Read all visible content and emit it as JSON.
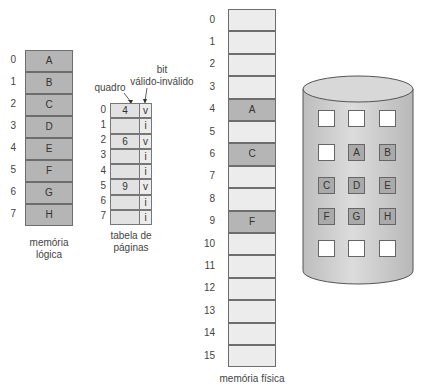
{
  "logical_memory": {
    "caption_line1": "memória",
    "caption_line2": "lógica",
    "rows": [
      {
        "index": "0",
        "page": "A"
      },
      {
        "index": "1",
        "page": "B"
      },
      {
        "index": "2",
        "page": "C"
      },
      {
        "index": "3",
        "page": "D"
      },
      {
        "index": "4",
        "page": "E"
      },
      {
        "index": "5",
        "page": "F"
      },
      {
        "index": "6",
        "page": "G"
      },
      {
        "index": "7",
        "page": "H"
      }
    ]
  },
  "page_table": {
    "label_frame": "quadro",
    "label_bit_line1": "bit",
    "label_bit_line2": "válido-inválido",
    "caption_line1": "tabela de",
    "caption_line2": "páginas",
    "rows": [
      {
        "index": "0",
        "frame": "4",
        "bit": "v"
      },
      {
        "index": "1",
        "frame": "",
        "bit": "i"
      },
      {
        "index": "2",
        "frame": "6",
        "bit": "v"
      },
      {
        "index": "3",
        "frame": "",
        "bit": "i"
      },
      {
        "index": "4",
        "frame": "",
        "bit": "i"
      },
      {
        "index": "5",
        "frame": "9",
        "bit": "v"
      },
      {
        "index": "6",
        "frame": "",
        "bit": "i"
      },
      {
        "index": "7",
        "frame": "",
        "bit": "i"
      }
    ]
  },
  "physical_memory": {
    "caption": "memória física",
    "rows": [
      {
        "index": "0",
        "content": ""
      },
      {
        "index": "1",
        "content": ""
      },
      {
        "index": "2",
        "content": ""
      },
      {
        "index": "3",
        "content": ""
      },
      {
        "index": "4",
        "content": "A"
      },
      {
        "index": "5",
        "content": ""
      },
      {
        "index": "6",
        "content": "C"
      },
      {
        "index": "7",
        "content": ""
      },
      {
        "index": "8",
        "content": ""
      },
      {
        "index": "9",
        "content": "F"
      },
      {
        "index": "10",
        "content": ""
      },
      {
        "index": "11",
        "content": ""
      },
      {
        "index": "12",
        "content": ""
      },
      {
        "index": "13",
        "content": ""
      },
      {
        "index": "14",
        "content": ""
      },
      {
        "index": "15",
        "content": ""
      }
    ]
  },
  "backing_store": {
    "grid": [
      [
        "",
        "",
        ""
      ],
      [
        "",
        "A",
        "B"
      ],
      [
        "C",
        "D",
        "E"
      ],
      [
        "F",
        "G",
        "H"
      ],
      [
        "",
        "",
        ""
      ]
    ]
  },
  "colors": {
    "page_fill": "#b5b5b5",
    "free_frame_fill": "#ececec",
    "cylinder_fill": "#cfcfcf"
  }
}
